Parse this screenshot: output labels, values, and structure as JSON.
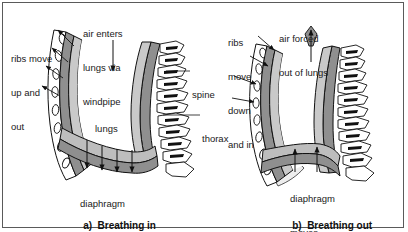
{
  "figure": {
    "border_color": "#5a5a5a",
    "background": "#ffffff"
  },
  "colors": {
    "outline": "#111111",
    "rib_fill": "#ffffff",
    "rib_band_fill": "#e6e6e6",
    "pleura_fill": "#8f8f8f",
    "lung_wall_fill": "#c9c9c9",
    "diaphragm_fill": "#bdbdbd",
    "light_shade": "#ededed",
    "text": "#1a1a1a"
  },
  "panels": [
    {
      "id": "panel-a",
      "caption_index": "a)",
      "caption_text": "Breathing in",
      "labels": [
        {
          "name": "ribs-move-label",
          "lines": [
            "ribs move",
            "up and",
            "out"
          ],
          "x": 11,
          "y": 30
        },
        {
          "name": "air-enters-label",
          "lines": [
            "air enters",
            "lungs via",
            "windpipe"
          ],
          "x": 83,
          "y": 5
        },
        {
          "name": "lungs-label",
          "lines": [
            "lungs"
          ],
          "x": 95,
          "y": 100
        },
        {
          "name": "spine-label",
          "lines": [
            "spine"
          ],
          "x": 192,
          "y": 66
        },
        {
          "name": "thorax-label",
          "lines": [
            "thorax"
          ],
          "x": 202,
          "y": 110
        },
        {
          "name": "diaphragm-moves-label",
          "lines": [
            "diaphragm",
            "moves",
            "downwards"
          ],
          "x": 80,
          "y": 175
        }
      ]
    },
    {
      "id": "panel-b",
      "caption_index": "b)",
      "caption_text": "Breathing out",
      "labels": [
        {
          "name": "ribs-move-down-label",
          "lines": [
            "ribs",
            "move",
            "down",
            "and in"
          ],
          "x": 228,
          "y": 14
        },
        {
          "name": "air-forced-out-label",
          "lines": [
            "air forced",
            "out of lungs"
          ],
          "x": 279,
          "y": 10
        },
        {
          "name": "diaphragm-moves-up-label",
          "lines": [
            "diaphragm",
            "moves",
            "upwards"
          ],
          "x": 290,
          "y": 170
        }
      ]
    }
  ],
  "captions": {
    "panel_a": {
      "index": "a)",
      "text": "Breathing in",
      "x": 72,
      "y": 209
    },
    "panel_b": {
      "index": "b)",
      "text": "Breathing out",
      "x": 281,
      "y": 209
    }
  }
}
